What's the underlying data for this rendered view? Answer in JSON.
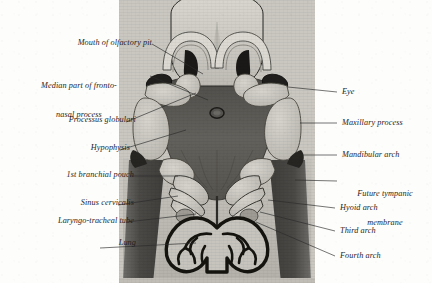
{
  "figure": {
    "background_color": "#fdfdfc",
    "line_color": "#2a2a2a",
    "tones": {
      "forehead": "#cfcdc6",
      "nasal_ridge": "#d8d6cf",
      "stomodeum": "#5e5c58",
      "arch_light": "#c9c7c0",
      "body_wall_dark": "#4a4845",
      "body_light": "#b9b7b0",
      "lung_field": "#c6c4bd",
      "outline": "#1b1b1b"
    }
  },
  "labels_left": [
    {
      "id": "mouth-of-olfactory-pit",
      "text": "Mouth of olfactory pit",
      "lines": [
        "Mouth of olfactory pit"
      ]
    },
    {
      "id": "median-part-of-frontonasal-process",
      "text": "Median part of fronto-nasal process",
      "lines": [
        "Median part of fronto-",
        "nasal process"
      ]
    },
    {
      "id": "processus-globulari",
      "text": "Processus globulari",
      "lines": [
        "Processus globulari"
      ]
    },
    {
      "id": "hypophysis",
      "text": "Hypophysis",
      "lines": [
        "Hypophysis"
      ]
    },
    {
      "id": "first-branchial-pouch",
      "text": "1st branchial pouch",
      "lines": [
        "1st branchial pouch"
      ]
    },
    {
      "id": "sinus-cervicalis",
      "text": "Sinus cervicalis",
      "lines": [
        "Sinus cervicalis"
      ]
    },
    {
      "id": "laryngo-tracheal-tube",
      "text": "Laryngo-tracheal tube",
      "lines": [
        "Laryngo-tracheal tube"
      ]
    },
    {
      "id": "lung",
      "text": "Lung",
      "lines": [
        "Lung"
      ]
    }
  ],
  "labels_right": [
    {
      "id": "eye",
      "text": "Eye",
      "lines": [
        "Eye"
      ]
    },
    {
      "id": "maxillary-process",
      "text": "Maxillary process",
      "lines": [
        "Maxillary process"
      ]
    },
    {
      "id": "mandibular-arch",
      "text": "Mandibular arch",
      "lines": [
        "Mandibular arch"
      ]
    },
    {
      "id": "future-tympanic-membrane",
      "text": "Future tympanic membrane",
      "lines": [
        "Future tympanic",
        "membrane"
      ]
    },
    {
      "id": "hyoid-arch",
      "text": "Hyoid arch",
      "lines": [
        "Hyoid arch"
      ]
    },
    {
      "id": "third-arch",
      "text": "Third arch",
      "lines": [
        "Third arch"
      ]
    },
    {
      "id": "fourth-arch",
      "text": "Fourth arch",
      "lines": [
        "Fourth arch"
      ]
    }
  ],
  "label_text": {
    "mouth_of_olfactory_pit": "Mouth of olfactory pit",
    "median_fronto_nasal_1": "Median part of fronto-",
    "median_fronto_nasal_2": "nasal process",
    "processus_globulari": "Processus globulari",
    "hypophysis": "Hypophysis",
    "first_branchial_pouch": "1st branchial pouch",
    "sinus_cervicalis": "Sinus cervicalis",
    "laryngo_tracheal_tube": "Laryngo-tracheal tube",
    "lung": "Lung",
    "eye": "Eye",
    "maxillary_process": "Maxillary process",
    "mandibular_arch": "Mandibular arch",
    "future_tympanic_1": "Future tympanic",
    "future_tympanic_2": "membrane",
    "hyoid_arch": "Hyoid arch",
    "third_arch": "Third arch",
    "fourth_arch": "Fourth arch"
  }
}
